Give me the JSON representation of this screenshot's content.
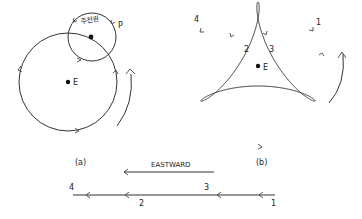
{
  "figure_a": {
    "caption": "(a)",
    "center_label": "E",
    "point_label": "P",
    "epicycle_label": "주전원"
  },
  "figure_b": {
    "caption": "(b)",
    "center_label": "E",
    "positions": [
      "1",
      "2",
      "3",
      "4"
    ]
  },
  "bottom": {
    "direction_label": "EASTWARD",
    "positions": [
      "4",
      "3",
      "2",
      "1"
    ]
  },
  "colors": {
    "line": "#333333",
    "text": "#222222",
    "background": "#ffffff"
  }
}
